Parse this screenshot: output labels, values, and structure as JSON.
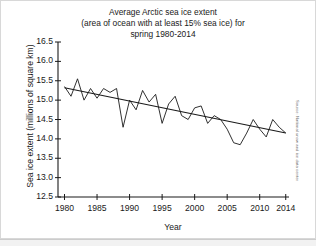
{
  "figure": {
    "source_note": "Source: National snow and ice data center",
    "background_color": "#ffffff",
    "line_color": "#1a1a1a"
  },
  "chart_data": {
    "type": "line",
    "title": "Average Arctic sea ice extent (area of ocean with at least 15% sea ice) for spring 1980-2014",
    "title_lines": [
      "Average Arctic sea ice extent",
      "(area of ocean with at least 15% sea ice) for",
      "spring 1980-2014"
    ],
    "xlabel": "Year",
    "ylabel": "Sea ice extent (millions of square km)",
    "xlim": [
      1979,
      2014.5
    ],
    "ylim": [
      12.5,
      16.5
    ],
    "yticks": [
      12.5,
      13.0,
      13.5,
      14.0,
      14.5,
      15.0,
      15.5,
      16.0,
      16.5
    ],
    "ytick_labels": [
      "12.5",
      "13.0",
      "13.5",
      "14.0",
      "14.5",
      "15.0",
      "15.5",
      "16.0",
      "16.5"
    ],
    "xticks": [
      1980,
      1985,
      1990,
      1995,
      2000,
      2005,
      2010,
      2014
    ],
    "xtick_labels": [
      "1980",
      "1985",
      "1990",
      "1995",
      "2000",
      "2005",
      "2010",
      "2014"
    ],
    "grid": false,
    "legend": false,
    "x": [
      1980,
      1981,
      1982,
      1983,
      1984,
      1985,
      1986,
      1987,
      1988,
      1989,
      1990,
      1991,
      1992,
      1993,
      1994,
      1995,
      1996,
      1997,
      1998,
      1999,
      2000,
      2001,
      2002,
      2003,
      2004,
      2005,
      2006,
      2007,
      2008,
      2009,
      2010,
      2011,
      2012,
      2013,
      2014
    ],
    "series": [
      {
        "name": "Spring sea ice extent",
        "values": [
          15.35,
          15.1,
          15.55,
          15.0,
          15.3,
          15.05,
          15.3,
          15.2,
          15.3,
          14.3,
          15.0,
          14.75,
          15.25,
          14.95,
          15.15,
          14.4,
          14.9,
          15.1,
          14.6,
          14.5,
          14.8,
          14.85,
          14.4,
          14.6,
          14.5,
          14.25,
          13.9,
          13.85,
          14.15,
          14.5,
          14.25,
          14.05,
          14.5,
          14.3,
          14.15
        ]
      },
      {
        "name": "Linear trend",
        "type": "trendline",
        "x": [
          1980,
          2014
        ],
        "values": [
          15.32,
          14.15
        ]
      }
    ]
  }
}
